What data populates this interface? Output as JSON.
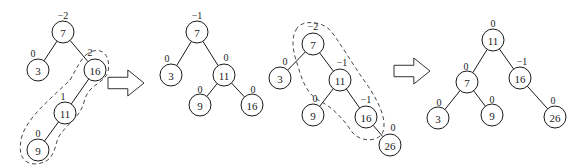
{
  "diagram": {
    "node_radius": 11,
    "colors": {
      "stroke": "#1a1a1a",
      "fill": "#ffffff",
      "dashed": "#333333"
    },
    "trees": [
      {
        "id": "tree-1",
        "nodes": [
          {
            "key": "7",
            "bf": "-2",
            "x": 63,
            "y": 32,
            "bfx": 63,
            "bfy": 15
          },
          {
            "key": "3",
            "bf": "0",
            "x": 38,
            "y": 70,
            "bfx": 33,
            "bfy": 53
          },
          {
            "key": "16",
            "bf": "2",
            "x": 95,
            "y": 70,
            "bfx": 90,
            "bfy": 52
          },
          {
            "key": "11",
            "bf": "1",
            "x": 65,
            "y": 113,
            "bfx": 63,
            "bfy": 96
          },
          {
            "key": "9",
            "bf": "0",
            "x": 38,
            "y": 150,
            "bfx": 38,
            "bfy": 133
          }
        ],
        "edges": [
          [
            "7",
            "3"
          ],
          [
            "7",
            "16"
          ],
          [
            "16",
            "11"
          ],
          [
            "11",
            "9"
          ]
        ],
        "dashed_outline": "M 86 55 C 96 46, 112 50, 108 72 C 104 84, 88 84, 84 102 C 80 118, 66 124, 58 138 C 54 150, 54 162, 36 164 C 20 164, 18 150, 22 136 C 28 116, 54 96, 70 80 C 76 70, 80 60, 86 55 Z"
      },
      {
        "id": "tree-2",
        "nodes": [
          {
            "key": "7",
            "bf": "-1",
            "x": 197,
            "y": 32,
            "bfx": 197,
            "bfy": 15
          },
          {
            "key": "3",
            "bf": "0",
            "x": 171,
            "y": 75,
            "bfx": 167,
            "bfy": 58
          },
          {
            "key": "11",
            "bf": "0",
            "x": 224,
            "y": 75,
            "bfx": 226,
            "bfy": 57
          },
          {
            "key": "9",
            "bf": "0",
            "x": 200,
            "y": 105,
            "bfx": 200,
            "bfy": 89
          },
          {
            "key": "16",
            "bf": "0",
            "x": 252,
            "y": 105,
            "bfx": 253,
            "bfy": 89
          }
        ],
        "edges": [
          [
            "7",
            "3"
          ],
          [
            "7",
            "11"
          ],
          [
            "11",
            "9"
          ],
          [
            "11",
            "16"
          ]
        ]
      },
      {
        "id": "tree-3",
        "nodes": [
          {
            "key": "7",
            "bf": "-2",
            "x": 313,
            "y": 44,
            "bfx": 313,
            "bfy": 26
          },
          {
            "key": "3",
            "bf": "0",
            "x": 280,
            "y": 78,
            "bfx": 285,
            "bfy": 61
          },
          {
            "key": "11",
            "bf": "-1",
            "x": 340,
            "y": 80,
            "bfx": 342,
            "bfy": 62
          },
          {
            "key": "9",
            "bf": "0",
            "x": 313,
            "y": 115,
            "bfx": 315,
            "bfy": 98
          },
          {
            "key": "16",
            "bf": "-1",
            "x": 366,
            "y": 117,
            "bfx": 366,
            "bfy": 99
          },
          {
            "key": "26",
            "bf": "0",
            "x": 390,
            "y": 145,
            "bfx": 393,
            "bfy": 127
          }
        ],
        "edges": [
          [
            "7",
            "3"
          ],
          [
            "7",
            "11"
          ],
          [
            "11",
            "9"
          ],
          [
            "11",
            "16"
          ],
          [
            "16",
            "26"
          ]
        ],
        "dashed_outline": "M 296 30 C 300 20, 320 20, 330 30 C 340 42, 352 64, 368 86 C 380 104, 388 122, 382 134 C 376 142, 360 142, 352 132 C 344 120, 334 108, 318 100 C 304 92, 300 72, 296 60 C 292 48, 292 36, 296 30 Z"
      },
      {
        "id": "tree-4",
        "nodes": [
          {
            "key": "11",
            "bf": "0",
            "x": 493,
            "y": 40,
            "bfx": 493,
            "bfy": 23
          },
          {
            "key": "7",
            "bf": "0",
            "x": 467,
            "y": 82,
            "bfx": 466,
            "bfy": 66
          },
          {
            "key": "16",
            "bf": "-1",
            "x": 520,
            "y": 78,
            "bfx": 522,
            "bfy": 61
          },
          {
            "key": "3",
            "bf": "0",
            "x": 438,
            "y": 118,
            "bfx": 439,
            "bfy": 102
          },
          {
            "key": "9",
            "bf": "0",
            "x": 492,
            "y": 115,
            "bfx": 492,
            "bfy": 99
          },
          {
            "key": "26",
            "bf": "0",
            "x": 555,
            "y": 117,
            "bfx": 553,
            "bfy": 100
          }
        ],
        "edges": [
          [
            "11",
            "7"
          ],
          [
            "11",
            "16"
          ],
          [
            "7",
            "3"
          ],
          [
            "7",
            "9"
          ],
          [
            "16",
            "26"
          ]
        ]
      }
    ],
    "arrows": [
      {
        "id": "arrow-1",
        "x": 108,
        "y": 70,
        "w": 36,
        "h": 26
      },
      {
        "id": "arrow-2",
        "x": 394,
        "y": 58,
        "w": 36,
        "h": 26
      }
    ]
  }
}
